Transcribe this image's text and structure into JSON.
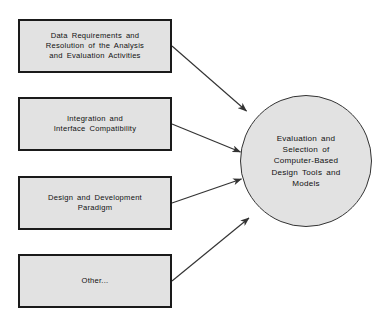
{
  "figure": {
    "type": "diagram",
    "kind": "convergent-arrow-diagram",
    "background_color": "#ffffff",
    "node_fill_color": "#e2e2e2",
    "node_border_color": "#1a1a1a",
    "arrow_color": "#333333"
  },
  "input_boxes": [
    {
      "id": "box-1",
      "label": "Data Requirements and\nResolution of the Analysis\nand Evaluation Activities"
    },
    {
      "id": "box-2",
      "label": "Integration and\nInterface Compatibility"
    },
    {
      "id": "box-3",
      "label": "Design and Development\nParadigm"
    },
    {
      "id": "box-4",
      "label": "Other..."
    }
  ],
  "hub": {
    "id": "hub-circle",
    "shape": "circle",
    "label": "Evaluation and\nSelection of\nComputer-Based\nDesign Tools and\nModels"
  },
  "arrows": [
    {
      "name": "arrow-box1-to-hub",
      "from": "box-1",
      "to": "hub-circle"
    },
    {
      "name": "arrow-box2-to-hub",
      "from": "box-2",
      "to": "hub-circle"
    },
    {
      "name": "arrow-box3-to-hub",
      "from": "box-3",
      "to": "hub-circle"
    },
    {
      "name": "arrow-box4-to-hub",
      "from": "box-4",
      "to": "hub-circle"
    }
  ],
  "caption": {
    "text": "",
    "note_visible": false
  }
}
